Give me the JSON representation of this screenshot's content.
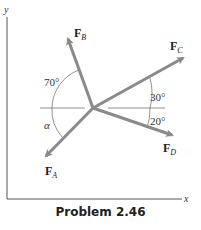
{
  "caption": "Problem 2.46",
  "axes": {
    "x_label": "x",
    "y_label": "y"
  },
  "forces": [
    {
      "id": "A",
      "label": "F",
      "subscript": "A"
    },
    {
      "id": "B",
      "label": "F",
      "subscript": "B"
    },
    {
      "id": "C",
      "label": "F",
      "subscript": "C"
    },
    {
      "id": "D",
      "label": "F",
      "subscript": "D"
    }
  ],
  "angles": {
    "B_from_horizontal": "70°",
    "A_from_horizontal": "α",
    "C_from_horizontal": "30°",
    "D_from_horizontal": "20°"
  },
  "colors": {
    "vector": "#8a8a8a",
    "axis": "#555555",
    "reference": "#777777"
  }
}
